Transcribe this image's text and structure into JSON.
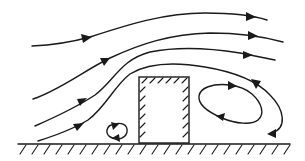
{
  "diagram": {
    "title": "Airflow streamlines around a building on the ground",
    "colors": {
      "line": "#1a1a1a",
      "background": "#ffffff"
    },
    "elements": {
      "streamlines": [
        {
          "name": "streamline-1",
          "direction": "left-to-right"
        },
        {
          "name": "streamline-2",
          "direction": "left-to-right"
        },
        {
          "name": "streamline-3",
          "direction": "left-to-right"
        },
        {
          "name": "streamline-4",
          "direction": "left-to-right, wraps into leeward recirculation"
        }
      ],
      "obstacle": "building-block",
      "vortices": [
        {
          "name": "leeward-recirculation-vortex",
          "rotation": "counterclockwise"
        },
        {
          "name": "windward-corner-eddy",
          "rotation": "clockwise"
        }
      ],
      "ground": "hatched-ground-surface"
    }
  }
}
